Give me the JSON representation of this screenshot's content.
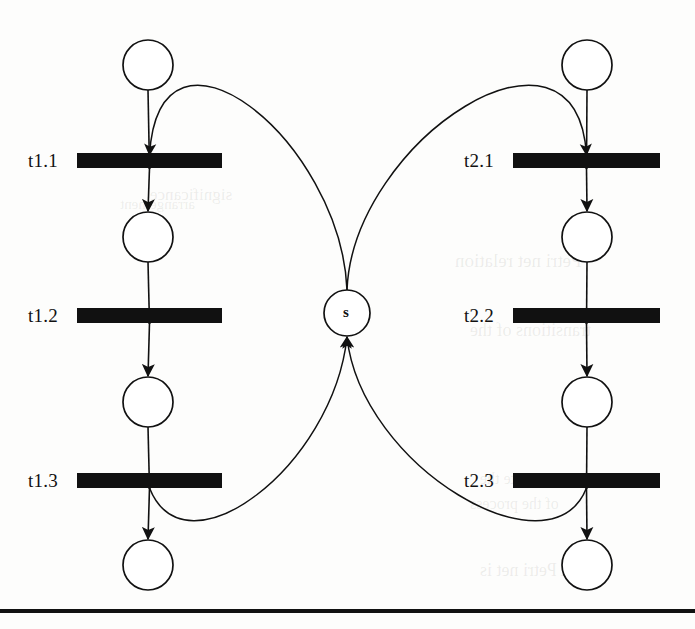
{
  "figure": {
    "kind": "petri-net",
    "background_color": "#fdfdfc",
    "ink_color": "#111111",
    "transition_fill": "#111111",
    "place_stroke": "#111111"
  },
  "places": [
    {
      "id": "p1.0",
      "label": "",
      "cx": 148,
      "cy": 65,
      "r": 25,
      "column": "left"
    },
    {
      "id": "p1.1",
      "label": "",
      "cx": 148,
      "cy": 237,
      "r": 25,
      "column": "left"
    },
    {
      "id": "p1.2",
      "label": "",
      "cx": 148,
      "cy": 402,
      "r": 25,
      "column": "left"
    },
    {
      "id": "p1.3",
      "label": "",
      "cx": 148,
      "cy": 565,
      "r": 25,
      "column": "left"
    },
    {
      "id": "s",
      "label": "s",
      "cx": 347,
      "cy": 313,
      "r": 23,
      "column": "center"
    },
    {
      "id": "p2.0",
      "label": "",
      "cx": 587,
      "cy": 65,
      "r": 25,
      "column": "right"
    },
    {
      "id": "p2.1",
      "label": "",
      "cx": 587,
      "cy": 237,
      "r": 25,
      "column": "right"
    },
    {
      "id": "p2.2",
      "label": "",
      "cx": 587,
      "cy": 402,
      "r": 25,
      "column": "right"
    },
    {
      "id": "p2.3",
      "label": "",
      "cx": 587,
      "cy": 565,
      "r": 25,
      "column": "right"
    }
  ],
  "transitions": [
    {
      "id": "t1.1",
      "label": "t1.1",
      "x": 77,
      "y": 153,
      "width": 145,
      "height": 15,
      "label_x": 28,
      "label_y": 150
    },
    {
      "id": "t1.2",
      "label": "t1.2",
      "x": 77,
      "y": 308,
      "width": 145,
      "height": 15,
      "label_x": 28,
      "label_y": 305
    },
    {
      "id": "t1.3",
      "label": "t1.3",
      "x": 77,
      "y": 473,
      "width": 145,
      "height": 15,
      "label_x": 28,
      "label_y": 470
    },
    {
      "id": "t2.1",
      "label": "t2.1",
      "x": 513,
      "y": 153,
      "width": 147,
      "height": 15,
      "label_x": 464,
      "label_y": 150
    },
    {
      "id": "t2.2",
      "label": "t2.2",
      "x": 513,
      "y": 308,
      "width": 147,
      "height": 15,
      "label_x": 464,
      "label_y": 305
    },
    {
      "id": "t2.3",
      "label": "t2.3",
      "x": 513,
      "y": 473,
      "width": 147,
      "height": 15,
      "label_x": 464,
      "label_y": 470
    }
  ],
  "arcs": [
    {
      "id": "a1",
      "from": "p1.0",
      "to": "t1.1",
      "shape": "straight"
    },
    {
      "id": "a2",
      "from": "t1.1",
      "to": "p1.1",
      "shape": "straight"
    },
    {
      "id": "a3",
      "from": "p1.1",
      "to": "t1.2",
      "shape": "straight"
    },
    {
      "id": "a4",
      "from": "t1.2",
      "to": "p1.2",
      "shape": "straight"
    },
    {
      "id": "a5",
      "from": "p1.2",
      "to": "t1.3",
      "shape": "straight"
    },
    {
      "id": "a6",
      "from": "t1.3",
      "to": "p1.3",
      "shape": "straight"
    },
    {
      "id": "a7",
      "from": "p2.0",
      "to": "t2.1",
      "shape": "straight"
    },
    {
      "id": "a8",
      "from": "t2.1",
      "to": "p2.1",
      "shape": "straight"
    },
    {
      "id": "a9",
      "from": "p2.1",
      "to": "t2.2",
      "shape": "straight"
    },
    {
      "id": "a10",
      "from": "t2.2",
      "to": "p2.2",
      "shape": "straight"
    },
    {
      "id": "a11",
      "from": "p2.2",
      "to": "t2.3",
      "shape": "straight"
    },
    {
      "id": "a12",
      "from": "t2.3",
      "to": "p2.3",
      "shape": "straight"
    },
    {
      "id": "a13",
      "from": "s",
      "to": "t1.1",
      "shape": "curve"
    },
    {
      "id": "a14",
      "from": "s",
      "to": "t2.1",
      "shape": "curve"
    },
    {
      "id": "a15",
      "from": "t1.3",
      "to": "s",
      "shape": "curve"
    },
    {
      "id": "a16",
      "from": "t2.3",
      "to": "s",
      "shape": "curve"
    }
  ],
  "rule": {
    "y": 609,
    "x": 0,
    "width": 695,
    "thickness": 4
  },
  "bleed_text": [
    {
      "text": "significance",
      "x": 150,
      "y": 185,
      "size": 17
    },
    {
      "text": "arrangement",
      "x": 120,
      "y": 196,
      "size": 15
    },
    {
      "text": "Petri net relation",
      "x": 455,
      "y": 250,
      "size": 19
    },
    {
      "text": "transitions of the",
      "x": 470,
      "y": 320,
      "size": 18
    },
    {
      "text": "to create the",
      "x": 480,
      "y": 470,
      "size": 16
    },
    {
      "text": "of the process",
      "x": 470,
      "y": 495,
      "size": 16
    },
    {
      "text": "A Petri net is",
      "x": 480,
      "y": 560,
      "size": 18
    }
  ]
}
